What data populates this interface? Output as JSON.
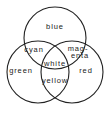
{
  "diagram": {
    "type": "venn",
    "circles": [
      {
        "label": "blue",
        "cx": 55,
        "cy": 38,
        "r": 31
      },
      {
        "label": "green",
        "cx": 38,
        "cy": 72,
        "r": 31
      },
      {
        "label": "red",
        "cx": 72,
        "cy": 72,
        "r": 31
      }
    ],
    "regions": {
      "blue": "blue",
      "green": "green",
      "red": "red",
      "cyan": "cyan",
      "magenta_line1": "mag-",
      "magenta_line2": "enta",
      "white": "white",
      "yellow": "yellow"
    },
    "stroke_color": "#222222"
  }
}
